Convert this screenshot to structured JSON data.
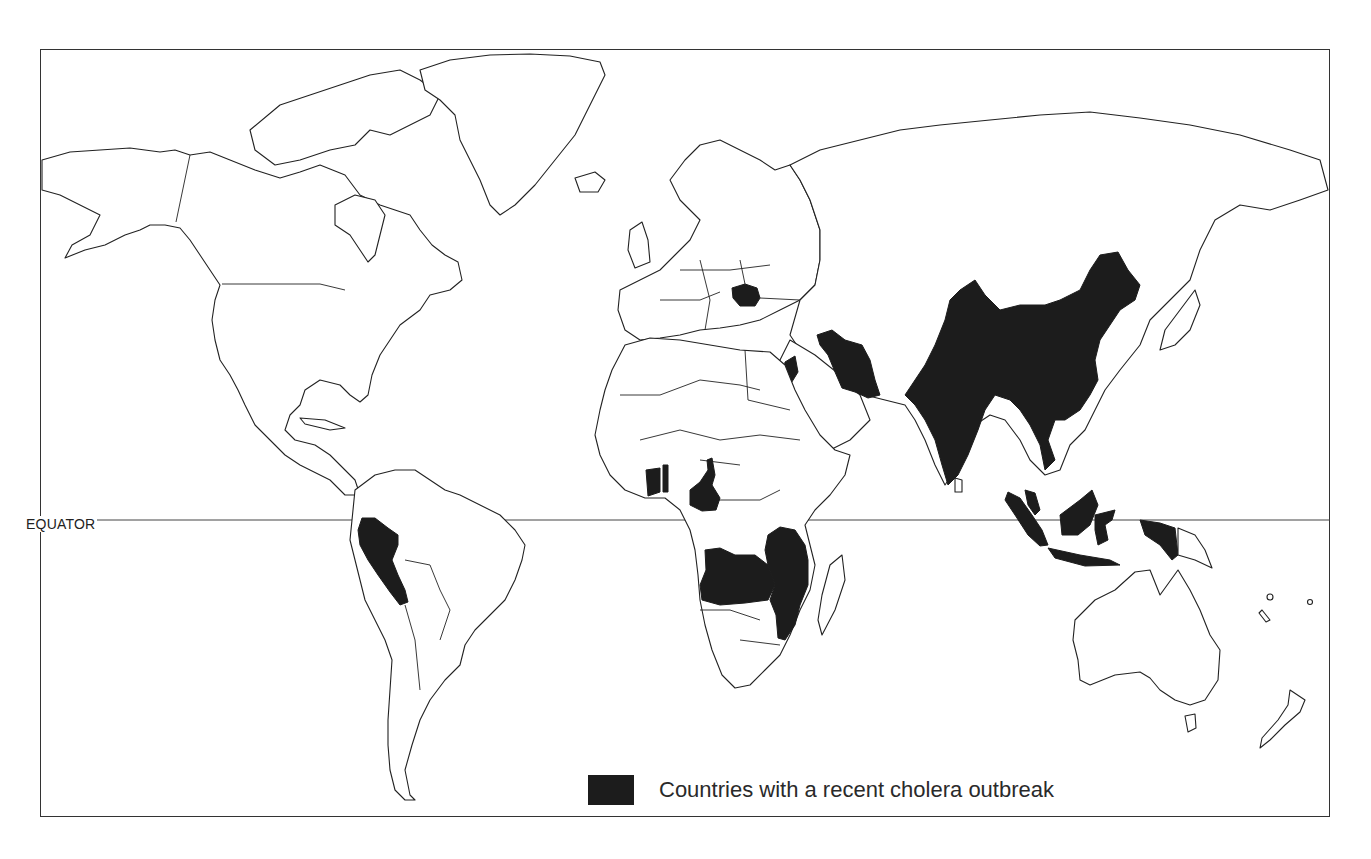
{
  "map": {
    "title": "",
    "equator_label": "EQUATOR",
    "legend": {
      "label": "Countries with a recent cholera outbreak",
      "swatch_color": "#1c1c1c"
    },
    "colors": {
      "outbreak_fill": "#1c1c1c",
      "land_fill": "#ffffff",
      "outline": "#222222",
      "background": "#ffffff"
    },
    "highlighted_regions": [
      "Peru",
      "Romania",
      "Israel/Palestine region",
      "Iran",
      "India",
      "China",
      "Vietnam",
      "Malaysia",
      "Indonesia",
      "Ghana",
      "Togo",
      "Cameroon",
      "Angola",
      "Zambia",
      "Tanzania",
      "Malawi",
      "Mozambique"
    ]
  }
}
